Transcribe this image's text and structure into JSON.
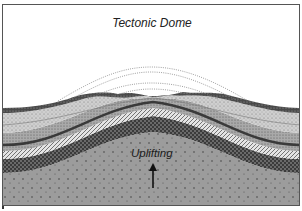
{
  "diagram": {
    "title": "Tectonic Dome",
    "labels": {
      "uplift": "Uplifting"
    },
    "arrow": {
      "direction": "up",
      "meaning": "uplift force"
    },
    "layers": [
      {
        "name": "eroded-former-layers",
        "style": "dotted outlines",
        "color": "#888888"
      },
      {
        "name": "top-dark-layer",
        "style": "dark crosshatch",
        "color": "#555555"
      },
      {
        "name": "light-stipple-layer",
        "style": "fine stipple",
        "color": "#c8c8c8"
      },
      {
        "name": "medium-stipple-layer",
        "style": "stipple",
        "color": "#a8a8a8"
      },
      {
        "name": "diagonal-hatch-layer",
        "style": "diagonal hatch",
        "color": "#d8d8d8"
      },
      {
        "name": "dark-crosshatch-layer",
        "style": "crosshatch",
        "color": "#5a5a5a"
      },
      {
        "name": "basement-rock",
        "style": "gray with dots",
        "color": "#9a9a9a"
      }
    ]
  }
}
